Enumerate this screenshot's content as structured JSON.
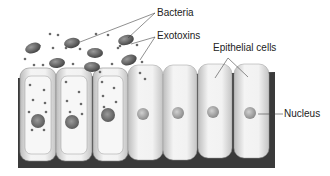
{
  "labels": {
    "bacteria": "Bacteria",
    "exotoxins": "Exotoxins",
    "epithelial_cells": "Epithelial cells",
    "nucleus": "Nucleus"
  },
  "cells": {
    "infected_count": 3,
    "healthy_count": 4
  },
  "colors": {
    "base": "#3a3a3a",
    "cell_fill": "#ececec",
    "bacteria": "#555555",
    "nucleus": "#9a9a9a"
  }
}
